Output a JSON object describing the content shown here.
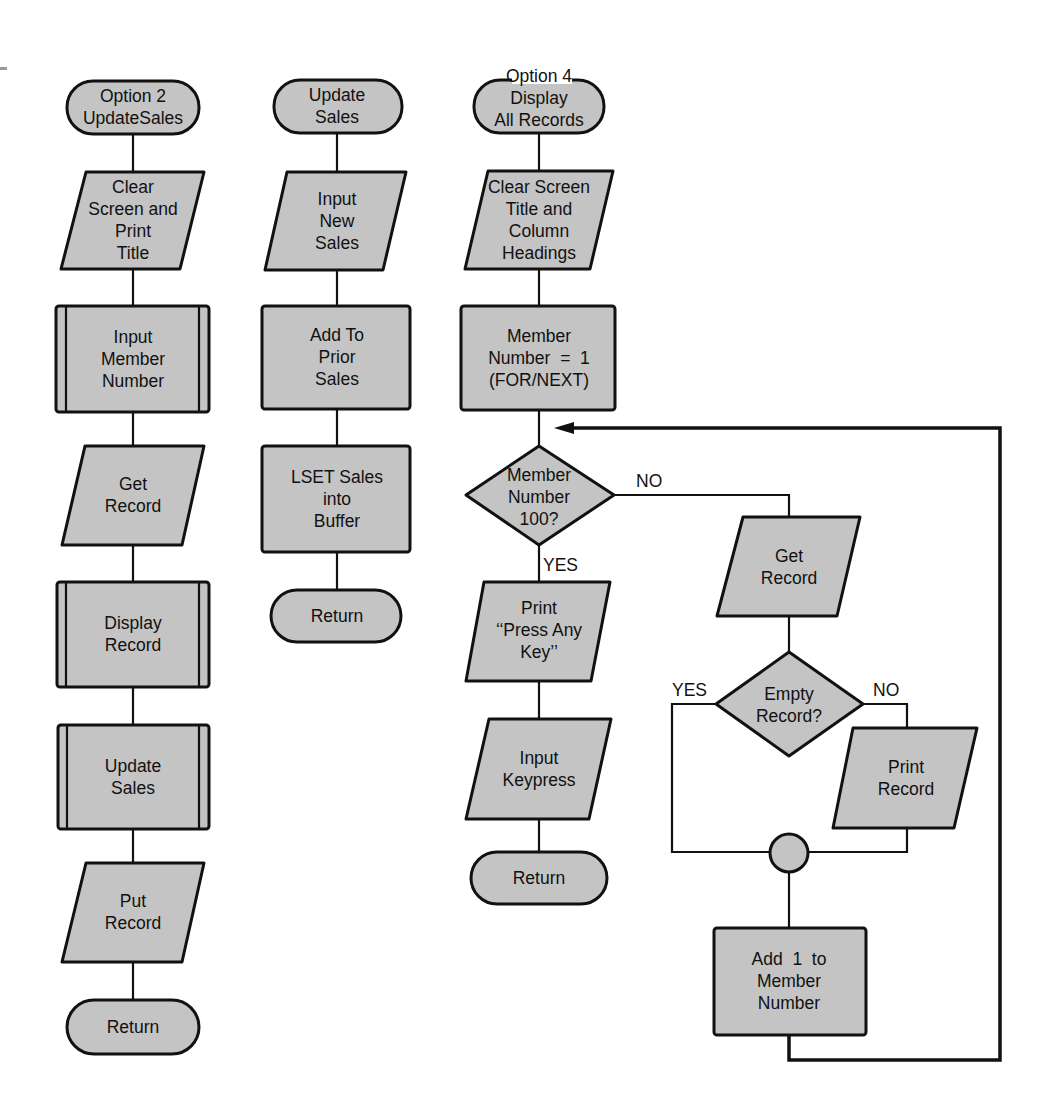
{
  "flowcharts": [
    {
      "id": "option2",
      "nodes": [
        {
          "type": "terminator",
          "label": "Option 2\nUpdateSales"
        },
        {
          "type": "io",
          "label": "Clear\nScreen and\nPrint\nTitle"
        },
        {
          "type": "predefined-process",
          "label": "Input\nMember\nNumber"
        },
        {
          "type": "io",
          "label": "Get\nRecord"
        },
        {
          "type": "predefined-process",
          "label": "Display\nRecord"
        },
        {
          "type": "predefined-process",
          "label": "Update\nSales"
        },
        {
          "type": "io",
          "label": "Put\nRecord"
        },
        {
          "type": "terminator",
          "label": "Return"
        }
      ]
    },
    {
      "id": "update_sales",
      "nodes": [
        {
          "type": "terminator",
          "label": "Update\nSales"
        },
        {
          "type": "io",
          "label": "Input\nNew\nSales"
        },
        {
          "type": "process",
          "label": "Add To\nPrior\nSales"
        },
        {
          "type": "process",
          "label": "LSET Sales\ninto\nBuffer"
        },
        {
          "type": "terminator",
          "label": "Return"
        }
      ]
    },
    {
      "id": "option4",
      "nodes": [
        {
          "type": "terminator",
          "label": "Option 4\nDisplay\nAll Records"
        },
        {
          "type": "io",
          "label": "Clear Screen\nTitle and\nColumn\nHeadings"
        },
        {
          "type": "process",
          "label": "Member\nNumber  =  1\n(FOR/NEXT)"
        },
        {
          "type": "decision",
          "label": "Member\nNumber\n100?"
        },
        {
          "type": "io",
          "label": "Print\n‘‘Press Any\nKey’’"
        },
        {
          "type": "io",
          "label": "Input\nKeypress"
        },
        {
          "type": "terminator",
          "label": "Return"
        },
        {
          "type": "io",
          "label": "Get\nRecord"
        },
        {
          "type": "decision",
          "label": "Empty\nRecord?"
        },
        {
          "type": "io",
          "label": "Print\nRecord"
        },
        {
          "type": "connector",
          "label": ""
        },
        {
          "type": "process",
          "label": "Add  1  to\nMember\nNumber"
        }
      ],
      "edge_labels": {
        "member_no": "NO",
        "member_yes": "YES",
        "empty_yes": "YES",
        "empty_no": "NO"
      }
    }
  ]
}
